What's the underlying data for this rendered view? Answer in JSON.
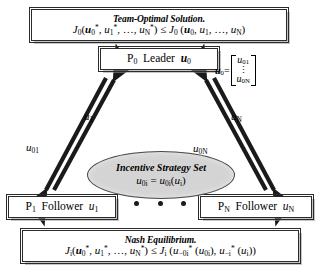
{
  "diagram": {
    "team_box": {
      "title": "Team-Optimal Solution.",
      "inequality_lhs": "J0(u0*, u1*, ..., uN*)",
      "relation": "≤",
      "inequality_rhs": "J0 (u0, u1, ..., uN)"
    },
    "leader_box": {
      "label": "P0 Leader u0",
      "player_id": "P0",
      "role": "Leader",
      "control": "u0"
    },
    "leader_vector": {
      "lhs": "u0=",
      "first_entry": "u01",
      "vdots": "⋮",
      "last_entry": "u0N"
    },
    "incentive_set": {
      "title": "Incentive Strategy Set",
      "equation": "u0i = u0i(ui)"
    },
    "follower1_box": {
      "label": "P1 Follower u1",
      "player_id": "P1",
      "role": "Follower",
      "control": "u1"
    },
    "followerN_box": {
      "label": "PN Follower uN",
      "player_id": "PN",
      "role": "Follower",
      "control": "uN"
    },
    "ellipsis": "• • •",
    "nash_box": {
      "title": "Nash Equilibrium.",
      "inequality_lhs": "Ji(u0*, u1*, ..., uN*)",
      "relation": "≤",
      "inequality_rhs": "Ji (u-0i*(u0i), u-i*(ui))"
    },
    "arrow_labels": {
      "left_up": "u1",
      "left_down": "u01",
      "right_up": "uN",
      "right_down": "u0N"
    },
    "colors": {
      "line": "#1a1a1a",
      "box_border": "#2b2b2b",
      "box_fill": "#ffffff",
      "ellipse_fill": "#d4d4d4",
      "ellipse_border": "#4a4a4a",
      "shadow": "#969696",
      "text": "#000000"
    }
  }
}
